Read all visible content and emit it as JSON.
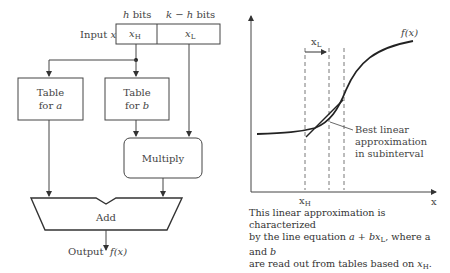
{
  "left_diagram": {
    "input_label": "Input x",
    "input_label_prefix": "Input",
    "input_label_var": "x",
    "h_bits": {
      "var": "h",
      "text": "bits"
    },
    "kh_bits": {
      "var": "k − h",
      "text": "bits"
    },
    "field_high": {
      "var": "x",
      "sub": "H"
    },
    "field_low": {
      "var": "x",
      "sub": "L"
    },
    "table_a": {
      "line1": "Table",
      "line2_prefix": "for",
      "line2_var": "a"
    },
    "table_b": {
      "line1": "Table",
      "line2_prefix": "for",
      "line2_var": "b"
    },
    "multiply": "Multiply",
    "add": "Add",
    "output": {
      "prefix": "Output",
      "func": "f(x)"
    }
  },
  "right_diagram": {
    "curve_label": "f(x)",
    "xl_label": {
      "var": "x",
      "sub": "L"
    },
    "xh_label": {
      "var": "x",
      "sub": "H"
    },
    "x_axis_label": "x",
    "annotation": [
      "Best linear",
      "approximation",
      "in subinterval"
    ],
    "caption": {
      "line1": "This linear approximation is characterized",
      "line2_a": "by the line equation ",
      "line2_eq_a": "a",
      "line2_plus": " + ",
      "line2_eq_b": "bx",
      "line2_eq_sub": "L",
      "line2_b": ", where a and ",
      "line2_bvar": "b",
      "line3_a": "are read out from tables based on ",
      "line3_var": "x",
      "line3_sub": "H",
      "line3_end": "."
    }
  }
}
